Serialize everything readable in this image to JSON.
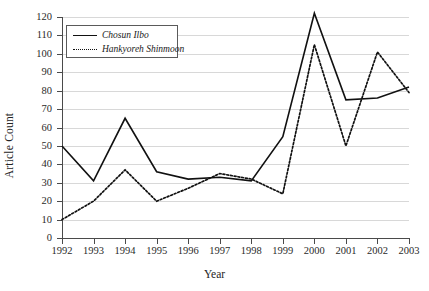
{
  "chart_data": {
    "type": "line",
    "title": "",
    "xlabel": "Year",
    "ylabel": "Article Count",
    "categories": [
      "1992",
      "1993",
      "1994",
      "1995",
      "1996",
      "1997",
      "1998",
      "1999",
      "2000",
      "2001",
      "2002",
      "2003"
    ],
    "ylim": [
      0,
      120
    ],
    "ytick_step": 10,
    "yticks": [
      "120",
      "110",
      "100",
      "90",
      "80",
      "70",
      "60",
      "50",
      "40",
      "30",
      "20",
      "10",
      "0"
    ],
    "grid": true,
    "grid_axis": "y",
    "legend_position": "top-left",
    "series": [
      {
        "name": "Chosun Ilbo",
        "style": "solid",
        "color": "#111111",
        "values": [
          50,
          31,
          65,
          36,
          32,
          33,
          31,
          55,
          122,
          75,
          76,
          82
        ]
      },
      {
        "name": "Hankyoreh Shinmoon",
        "style": "dotted",
        "color": "#111111",
        "values": [
          10,
          20,
          37,
          20,
          27,
          35,
          32,
          24,
          105,
          50,
          101,
          79
        ]
      }
    ]
  }
}
